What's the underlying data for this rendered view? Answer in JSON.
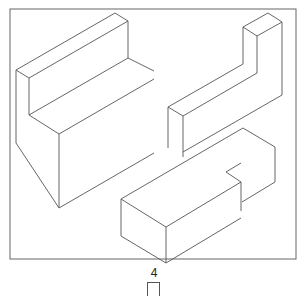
{
  "figure": {
    "frame": {
      "x": 10,
      "y": 9,
      "w": 286,
      "h": 250,
      "stroke": "#666666"
    },
    "stroke_color": "#555555",
    "shapes": [
      {
        "name": "l-shaped-block-left",
        "lines": [
          [
            16,
            70,
            115,
            13
          ],
          [
            115,
            13,
            128,
            21
          ],
          [
            128,
            21,
            29,
            78
          ],
          [
            16,
            70,
            29,
            78
          ],
          [
            16,
            70,
            16,
            143
          ],
          [
            29,
            78,
            29,
            115
          ],
          [
            29,
            115,
            128,
            58
          ],
          [
            128,
            21,
            128,
            58
          ],
          [
            128,
            58,
            154,
            71
          ],
          [
            29,
            115,
            59,
            134
          ],
          [
            59,
            134,
            154,
            79
          ],
          [
            59,
            134,
            59,
            208
          ],
          [
            16,
            143,
            59,
            208
          ],
          [
            59,
            208,
            154,
            153
          ]
        ]
      },
      {
        "name": "l-shaped-block-right",
        "lines": [
          [
            243,
            27,
            268,
            13
          ],
          [
            268,
            13,
            282,
            22
          ],
          [
            282,
            22,
            257,
            36
          ],
          [
            243,
            27,
            257,
            36
          ],
          [
            243,
            27,
            243,
            64
          ],
          [
            257,
            36,
            257,
            73
          ],
          [
            243,
            64,
            168,
            107
          ],
          [
            257,
            73,
            183,
            116
          ],
          [
            168,
            107,
            183,
            116
          ],
          [
            168,
            107,
            168,
            148
          ],
          [
            183,
            116,
            183,
            157
          ],
          [
            282,
            22,
            282,
            95
          ],
          [
            282,
            95,
            183,
            152
          ]
        ]
      },
      {
        "name": "notched-block-bottom",
        "lines": [
          [
            121,
            199,
            243,
            128
          ],
          [
            243,
            128,
            275,
            147
          ],
          [
            275,
            147,
            275,
            182
          ],
          [
            275,
            182,
            242,
            202
          ],
          [
            226,
            172,
            241,
            163
          ],
          [
            226,
            172,
            241,
            182
          ],
          [
            241,
            182,
            241,
            211
          ],
          [
            121,
            199,
            166,
            227
          ],
          [
            166,
            227,
            241,
            182
          ],
          [
            121,
            199,
            121,
            236
          ],
          [
            166,
            227,
            166,
            263
          ],
          [
            121,
            236,
            166,
            263
          ],
          [
            166,
            263,
            241,
            218
          ]
        ]
      }
    ],
    "label": "4"
  }
}
